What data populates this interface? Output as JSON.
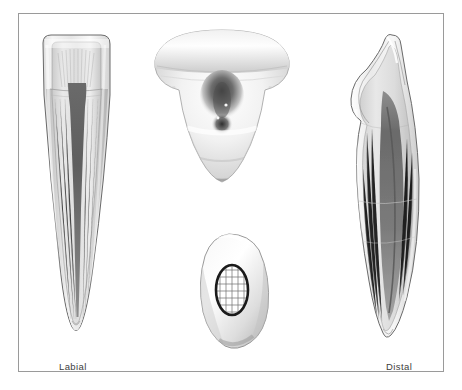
{
  "figure": {
    "frame_border_color": "#9a9a9a",
    "background_color": "#ffffff",
    "ink_color": "#3d3d3d"
  },
  "labels": {
    "labial": "Labial",
    "distal": "Distal"
  },
  "views": [
    {
      "id": "labial-section",
      "name": "Labial",
      "label_visible": true,
      "description": "Labiolingual longitudinal section of crown and root showing pulp chamber and root canal",
      "position": {
        "x": 30,
        "y": 28,
        "width": 90,
        "height": 312
      }
    },
    {
      "id": "incisal-lingual",
      "name": "Incisal / lingual surface",
      "label_visible": false,
      "description": "Lingual aspect of the crown showing cingulum and lingual fossa shading",
      "position": {
        "x": 148,
        "y": 24,
        "width": 145,
        "height": 162
      }
    },
    {
      "id": "root-cross-section",
      "name": "Root cross section",
      "label_visible": false,
      "description": "Transverse cross section of the root with the outlined root canal filled by a grid pattern",
      "position": {
        "x": 180,
        "y": 228,
        "width": 100,
        "height": 118
      },
      "canal_grid": {
        "columns": 5,
        "rows": 7,
        "outline_color": "#1a1a1a",
        "grid_color": "#6f6f6f"
      }
    },
    {
      "id": "distal-section",
      "name": "Distal",
      "label_visible": true,
      "description": "Mesiodistal longitudinal section showing the narrow tapering pulp canal",
      "position": {
        "x": 340,
        "y": 28,
        "width": 96,
        "height": 312
      }
    }
  ],
  "palette": {
    "enamel": "#f4f4f4",
    "dentin": "#d9d9d9",
    "dentin_shadow": "#bdbdbd",
    "pulp_dark": "#6d6d6d",
    "pulp_darkest": "#4a4a4a",
    "outline": "#5d5d5d"
  }
}
